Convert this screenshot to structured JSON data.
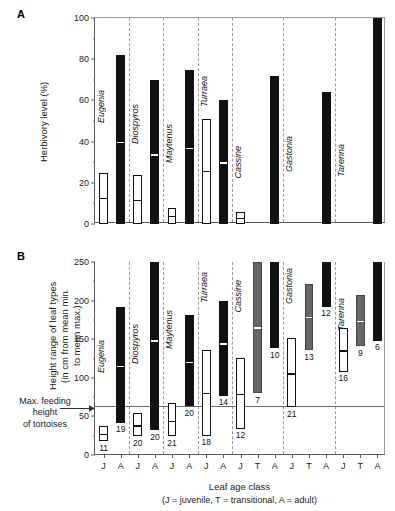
{
  "figure": {
    "panels": [
      {
        "id": "A",
        "letter": "A"
      },
      {
        "id": "B",
        "letter": "B"
      }
    ]
  },
  "panel_a": {
    "letter": "A",
    "ylabel": "Herbivory level (%)",
    "yticks": [
      0,
      20,
      40,
      60,
      80,
      100
    ]
  },
  "panel_b": {
    "letter": "B",
    "ylabel": "Height range of leaf types\n(in cm from mean min.\nto mean max.)",
    "ylabel_line1": "Height range of leaf types",
    "ylabel_line2": "(in cm from mean min.",
    "ylabel_line3": "to mean max.)",
    "yticks": [
      0,
      50,
      100,
      150,
      200,
      250
    ],
    "xlabel": "Leaf age class",
    "xlabel_sub": "(J = juvenile, T = transitional, A = adult)",
    "annotation": {
      "line1": "Max. feeding",
      "line2": "height",
      "line3": "of tortoises",
      "value": 63
    }
  },
  "species": [
    "Eugenia",
    "Diospyros",
    "Maytenus",
    "Turraea",
    "Cassine",
    "Gastonia",
    "Tarenna"
  ],
  "xtick_labels": [
    "J",
    "A",
    "J",
    "A",
    "J",
    "A",
    "J",
    "A",
    "J",
    "T",
    "A",
    "J",
    "T",
    "A",
    "J",
    "T",
    "A"
  ],
  "chart_data": [
    {
      "type": "bar",
      "panel": "A",
      "title": "",
      "xlabel": "",
      "ylabel": "Herbivory level (%)",
      "ylim": [
        0,
        100
      ],
      "yticks": [
        0,
        20,
        40,
        60,
        80,
        100
      ],
      "grid": false,
      "categories": [
        "J",
        "A",
        "J",
        "A",
        "J",
        "A",
        "J",
        "A",
        "J",
        "T",
        "A",
        "J",
        "T",
        "A",
        "J",
        "T",
        "A"
      ],
      "groups": [
        "Eugenia",
        "Eugenia",
        "Diospyros",
        "Diospyros",
        "Maytenus",
        "Maytenus",
        "Turraea",
        "Turraea",
        "Cassine",
        "Cassine",
        "Cassine",
        "Gastonia",
        "Gastonia",
        "Gastonia",
        "Tarenna",
        "Tarenna",
        "Tarenna"
      ],
      "bars": [
        {
          "slot": 0,
          "species": "Eugenia",
          "age": "J",
          "fill": "white",
          "top": 25,
          "bottom": 0,
          "mean": 13
        },
        {
          "slot": 1,
          "species": "Eugenia",
          "age": "A",
          "fill": "black",
          "top": 82,
          "bottom": 0,
          "mean": 40
        },
        {
          "slot": 2,
          "species": "Diospyros",
          "age": "J",
          "fill": "white",
          "top": 24,
          "bottom": 0,
          "mean": 12
        },
        {
          "slot": 3,
          "species": "Diospyros",
          "age": "A",
          "fill": "black",
          "top": 70,
          "bottom": 0,
          "mean": 34
        },
        {
          "slot": 4,
          "species": "Maytenus",
          "age": "J",
          "fill": "white",
          "top": 8,
          "bottom": 0,
          "mean": 4
        },
        {
          "slot": 5,
          "species": "Maytenus",
          "age": "A",
          "fill": "black",
          "top": 75,
          "bottom": 0,
          "mean": 37
        },
        {
          "slot": 6,
          "species": "Turraea",
          "age": "J",
          "fill": "white",
          "top": 51,
          "bottom": 0,
          "mean": 26
        },
        {
          "slot": 7,
          "species": "Turraea",
          "age": "A",
          "fill": "black",
          "top": 60,
          "bottom": 0,
          "mean": 30
        },
        {
          "slot": 8,
          "species": "Cassine",
          "age": "J",
          "fill": "white",
          "top": 6,
          "bottom": 0,
          "mean": 3
        },
        {
          "slot": 10,
          "species": "Cassine",
          "age": "A",
          "fill": "black",
          "top": 72,
          "bottom": 0,
          "mean": null
        },
        {
          "slot": 13,
          "species": "Gastonia",
          "age": "A",
          "fill": "black",
          "top": 64,
          "bottom": 0,
          "mean": null
        },
        {
          "slot": 16,
          "species": "Tarenna",
          "age": "A",
          "fill": "black",
          "top": 100,
          "bottom": 0,
          "mean": null
        }
      ]
    },
    {
      "type": "bar",
      "panel": "B",
      "title": "",
      "xlabel": "Leaf age class (J = juvenile, T = transitional, A = adult)",
      "ylabel": "Height range of leaf types (in cm from mean min. to mean max.)",
      "ylim": [
        0,
        250
      ],
      "yticks": [
        0,
        50,
        100,
        150,
        200,
        250
      ],
      "grid": false,
      "reference_line": {
        "label": "Max. feeding height of tortoises",
        "value": 63
      },
      "categories": [
        "J",
        "A",
        "J",
        "A",
        "J",
        "A",
        "J",
        "A",
        "J",
        "T",
        "A",
        "J",
        "T",
        "A",
        "J",
        "T",
        "A"
      ],
      "bars": [
        {
          "slot": 0,
          "species": "Eugenia",
          "age": "J",
          "fill": "white",
          "min": 18,
          "max": 38,
          "mean": 28,
          "n": 11
        },
        {
          "slot": 1,
          "species": "Eugenia",
          "age": "A",
          "fill": "black",
          "min": 42,
          "max": 192,
          "mean": 116,
          "n": 19
        },
        {
          "slot": 2,
          "species": "Diospyros",
          "age": "J",
          "fill": "white",
          "min": 24,
          "max": 54,
          "mean": 39,
          "n": 20
        },
        {
          "slot": 3,
          "species": "Diospyros",
          "age": "A",
          "fill": "black",
          "min": 32,
          "max": 255,
          "mean": 149,
          "n": 20
        },
        {
          "slot": 4,
          "species": "Maytenus",
          "age": "J",
          "fill": "white",
          "min": 24,
          "max": 67,
          "mean": 45,
          "n": 21
        },
        {
          "slot": 5,
          "species": "Maytenus",
          "age": "A",
          "fill": "black",
          "min": 63,
          "max": 181,
          "mean": 121,
          "n": 20
        },
        {
          "slot": 6,
          "species": "Turraea",
          "age": "J",
          "fill": "white",
          "min": 25,
          "max": 136,
          "mean": 81,
          "n": 18
        },
        {
          "slot": 7,
          "species": "Turraea",
          "age": "A",
          "fill": "black",
          "min": 77,
          "max": 199,
          "mean": 145,
          "n": 14
        },
        {
          "slot": 8,
          "species": "Cassine",
          "age": "J",
          "fill": "white",
          "min": 34,
          "max": 126,
          "mean": 80,
          "n": 12
        },
        {
          "slot": 9,
          "species": "Cassine",
          "age": "T",
          "fill": "gray",
          "min": 80,
          "max": 255,
          "mean": 166,
          "n": 7
        },
        {
          "slot": 10,
          "species": "Cassine",
          "age": "A",
          "fill": "black",
          "min": 138,
          "max": 255,
          "mean": null,
          "n": 10
        },
        {
          "slot": 11,
          "species": "Gastonia",
          "age": "J",
          "fill": "white",
          "min": 62,
          "max": 152,
          "mean": 106,
          "n": 21
        },
        {
          "slot": 12,
          "species": "Gastonia",
          "age": "T",
          "fill": "gray",
          "min": 136,
          "max": 222,
          "mean": 179,
          "n": 13
        },
        {
          "slot": 13,
          "species": "Gastonia",
          "age": "A",
          "fill": "black",
          "min": 192,
          "max": 255,
          "mean": null,
          "n": 12
        },
        {
          "slot": 14,
          "species": "Tarenna",
          "age": "J",
          "fill": "white",
          "min": 108,
          "max": 164,
          "mean": 136,
          "n": 16
        },
        {
          "slot": 15,
          "species": "Tarenna",
          "age": "T",
          "fill": "gray",
          "min": 141,
          "max": 207,
          "mean": 174,
          "n": 9
        },
        {
          "slot": 16,
          "species": "Tarenna",
          "age": "A",
          "fill": "black",
          "min": 148,
          "max": 255,
          "mean": null,
          "n": 6
        }
      ]
    }
  ]
}
